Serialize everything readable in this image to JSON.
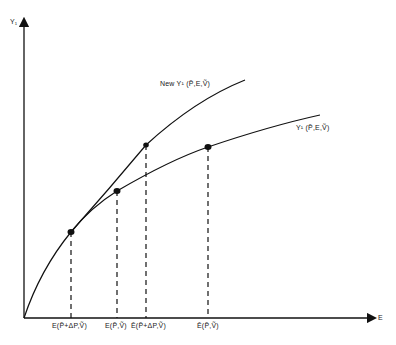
{
  "diagram": {
    "y_axis_label": "Y₁",
    "x_axis_label": "E",
    "curves": [
      {
        "id": "new",
        "label": "New Y¹ (P̃,E,Ṽ)"
      },
      {
        "id": "old",
        "label": "Y¹ (P̃,E,Ṽ)"
      }
    ],
    "x_ticks": [
      {
        "label": "E(P̃+ΔP,Ṽ)",
        "x": 71
      },
      {
        "label": "E(P̃,Ṽ)",
        "x": 117
      },
      {
        "label": "Ē(P̃+ΔP,Ṽ)",
        "x": 146
      },
      {
        "label": "Ē(P̃,Ṽ)",
        "x": 208
      }
    ],
    "points": [
      {
        "x": 71,
        "y": 232
      },
      {
        "x": 117,
        "y": 191
      },
      {
        "x": 146,
        "y": 145
      },
      {
        "x": 208,
        "y": 147
      }
    ],
    "line_color": "#111111"
  }
}
